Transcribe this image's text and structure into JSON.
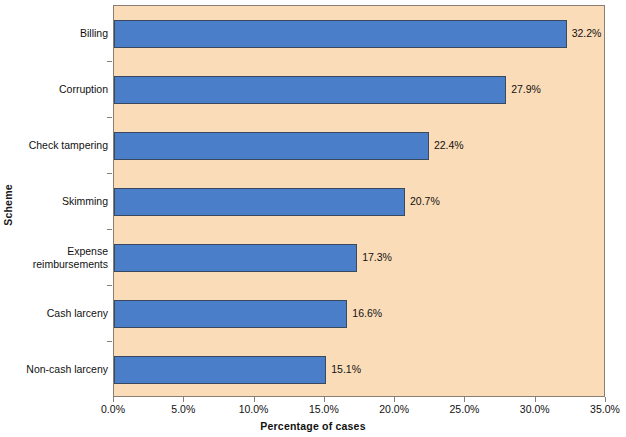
{
  "chart_data": {
    "type": "bar",
    "orientation": "horizontal",
    "title": "",
    "xlabel": "Percentage of cases",
    "ylabel": "Scheme",
    "categories": [
      "Billing",
      "Corruption",
      "Check tampering",
      "Skimming",
      "Expense\nreimbursements",
      "Cash larceny",
      "Non-cash larceny"
    ],
    "values": [
      32.2,
      27.9,
      22.4,
      20.7,
      17.3,
      16.6,
      15.1
    ],
    "data_labels": [
      "32.2%",
      "27.9%",
      "22.4%",
      "20.7%",
      "17.3%",
      "16.6%",
      "15.1%"
    ],
    "xlim": [
      0,
      35
    ],
    "x_tick_values": [
      0,
      5,
      10,
      15,
      20,
      25,
      30,
      35
    ],
    "x_tick_labels": [
      "0.0%",
      "5.0%",
      "10.0%",
      "15.0%",
      "20.0%",
      "25.0%",
      "30.0%",
      "35.0%"
    ],
    "grid": false,
    "legend": null,
    "colors": {
      "bar_fill": "#4a7ec8",
      "bar_border": "#3a4a5e",
      "plot_background": "#fadcb8",
      "plot_border": "#8a7f72",
      "figure_background": "#ffffff",
      "text": "#111111"
    }
  }
}
